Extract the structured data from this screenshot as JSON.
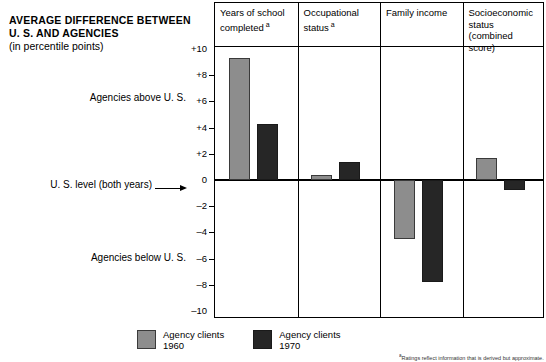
{
  "title": {
    "line1": "AVERAGE DIFFERENCE BETWEEN",
    "line2": "U. S. AND AGENCIES",
    "line3": "(in percentile points)"
  },
  "annotations": {
    "above": "Agencies above U. S.",
    "below": "Agencies below U. S.",
    "zero": "U. S. level (both years)"
  },
  "legend": [
    {
      "label_line1": "Agency clients",
      "label_line2": "1960",
      "color": "#8d8d8d",
      "swatch": "light-gray-swatch"
    },
    {
      "label_line1": "Agency clients",
      "label_line2": "1970",
      "color": "#262626",
      "swatch": "dark-swatch"
    }
  ],
  "footnote": {
    "marker": "a",
    "text": "Ratings reflect information that is derived but approximate."
  },
  "axis": {
    "ticks": [
      "+10",
      "+8",
      "+6",
      "+4",
      "+2",
      "0",
      "–2",
      "–4",
      "–6",
      "–8",
      "–10"
    ],
    "tick_values": [
      10,
      8,
      6,
      4,
      2,
      0,
      -2,
      -4,
      -6,
      -8,
      -10
    ]
  },
  "chart_data": {
    "type": "bar",
    "title": "AVERAGE DIFFERENCE BETWEEN U. S. AND AGENCIES (in percentile points)",
    "xlabel": "",
    "ylabel": "Percentile points",
    "ylim": [
      -10,
      10
    ],
    "grid": false,
    "legend_position": "bottom",
    "zero_reference_label": "U. S. level (both years)",
    "categories": [
      "Years of school completed",
      "Occupational status",
      "Family income",
      "Socioeconomic status (combined score)"
    ],
    "category_footnote_markers": [
      "a",
      "a",
      "",
      ""
    ],
    "series": [
      {
        "name": "Agency clients 1960",
        "color": "#8d8d8d",
        "values": [
          9.3,
          0.4,
          -4.5,
          1.7
        ]
      },
      {
        "name": "Agency clients 1970",
        "color": "#262626",
        "values": [
          4.3,
          1.4,
          -7.8,
          -0.8
        ]
      }
    ],
    "annotations": [
      "Agencies above U. S.",
      "Agencies below U. S."
    ]
  },
  "panels": [
    {
      "header_line1": "Years of school",
      "header_line2": "completed",
      "header_line3": "",
      "sup": "a"
    },
    {
      "header_line1": "Occupational",
      "header_line2": "status",
      "header_line3": "",
      "sup": "a"
    },
    {
      "header_line1": "Family income",
      "header_line2": "",
      "header_line3": "",
      "sup": ""
    },
    {
      "header_line1": "Socioeconomic",
      "header_line2": "status",
      "header_line3": "(combined score)",
      "sup": ""
    }
  ]
}
